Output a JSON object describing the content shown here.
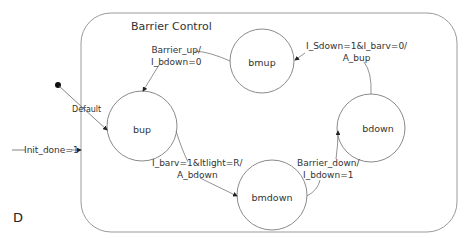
{
  "diagram": {
    "type": "state-machine",
    "corner_label": "D",
    "composite_state": {
      "title": "Barrier Control"
    },
    "states": [
      {
        "id": "bmup",
        "label": "bmup"
      },
      {
        "id": "bup",
        "label": "bup"
      },
      {
        "id": "bdown",
        "label": "bdown"
      },
      {
        "id": "bmdown",
        "label": "bmdown"
      }
    ],
    "transitions": {
      "entry": {
        "label": "Init_done=1"
      },
      "default": {
        "label": "Default"
      },
      "bmup_to_bup": {
        "line1": "Barrier_up/",
        "line2": "I_bdown=0"
      },
      "bdown_to_bmup": {
        "line1": "I_Sdown=1&I_barv=0/",
        "line2": "A_bup"
      },
      "bup_to_bmdown": {
        "line1": "I_barv=1&Itlight=R/",
        "line2": "A_bdown"
      },
      "bmdown_to_bdown": {
        "line1": "Barrier_down/",
        "line2": "I_bdown=1"
      }
    },
    "colors": {
      "line": "#8a8a8a",
      "text": "#333333",
      "arrow": "#222222"
    }
  }
}
